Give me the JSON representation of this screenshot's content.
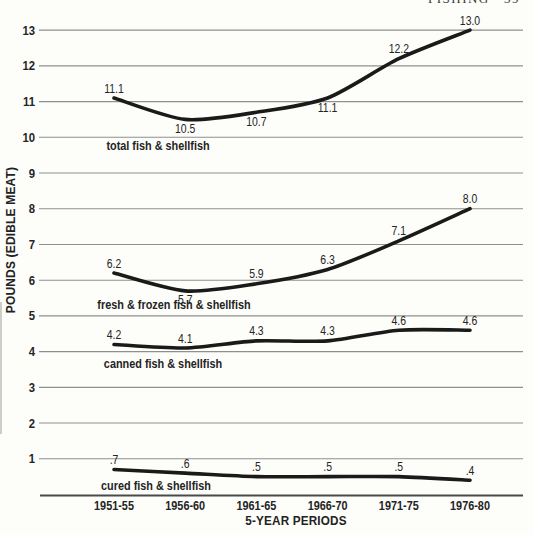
{
  "page": {
    "header_right": "FISHING   39"
  },
  "chart_data": {
    "type": "line",
    "title": "",
    "xlabel": "5-YEAR PERIODS",
    "ylabel": "POUNDS (EDIBLE MEAT)",
    "categories": [
      "1951-55",
      "1956-60",
      "1961-65",
      "1966-70",
      "1971-75",
      "1976-80"
    ],
    "series": [
      {
        "name": "total fish & shellfish",
        "values": [
          11.1,
          10.5,
          10.7,
          11.1,
          12.2,
          13.0
        ],
        "point_labels": [
          "11.1",
          "10.5",
          "10.7",
          "11.1",
          "12.2",
          "13.0"
        ],
        "label_side": [
          "above",
          "below",
          "below",
          "below",
          "above",
          "above"
        ],
        "name_pos": {
          "x": 158,
          "y": 150
        }
      },
      {
        "name": "fresh & frozen fish & shellfish",
        "values": [
          6.2,
          5.7,
          5.9,
          6.3,
          7.1,
          8.0
        ],
        "point_labels": [
          "6.2",
          "5.7",
          "5.9",
          "6.3",
          "7.1",
          "8.0"
        ],
        "label_side": [
          "above",
          "below",
          "above",
          "above",
          "above",
          "above"
        ],
        "name_pos": {
          "x": 174,
          "y": 309
        }
      },
      {
        "name": "canned fish & shellfish",
        "values": [
          4.2,
          4.1,
          4.3,
          4.3,
          4.6,
          4.6
        ],
        "point_labels": [
          "4.2",
          "4.1",
          "4.3",
          "4.3",
          "4.6",
          "4.6"
        ],
        "label_side": [
          "above",
          "above",
          "above",
          "above",
          "above",
          "above"
        ],
        "name_pos": {
          "x": 163,
          "y": 368
        }
      },
      {
        "name": "cured fish & shellfish",
        "values": [
          0.7,
          0.6,
          0.5,
          0.5,
          0.5,
          0.4
        ],
        "point_labels": [
          ".7",
          ".6",
          ".5",
          ".5",
          ".5",
          ".4"
        ],
        "label_side": [
          "above",
          "above",
          "above",
          "above",
          "above",
          "above"
        ],
        "name_pos": {
          "x": 156,
          "y": 490
        }
      }
    ],
    "y_ticks": [
      1,
      2,
      3,
      4,
      5,
      6,
      7,
      8,
      9,
      10,
      11,
      12,
      13
    ],
    "ylim": [
      0,
      13.5
    ],
    "grid": "horizontal-only",
    "legend": "inline-series-labels",
    "line_color": "#1a1a1a",
    "grid_color": "#8f8f8f",
    "axis_color": "#4a4a4a",
    "text_color": "#242424"
  }
}
